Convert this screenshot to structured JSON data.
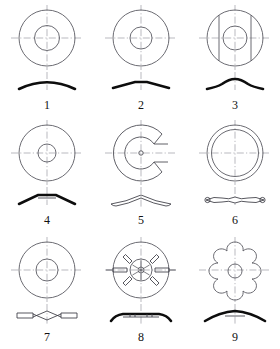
{
  "plate": {
    "title": "Washer types plate",
    "background_color": "#ffffff",
    "line_color": "#5a5a62",
    "centerline_color": "#8b8b93",
    "profile_color": "#0d0d0d",
    "caption_color": "#111111",
    "columns": 3,
    "rows": 3
  },
  "figures": [
    {
      "number": "1",
      "name": "curved-spring-washer",
      "plan_view": "annulus with centerlines",
      "profile_view": "thick curved arc, dished",
      "outer_radius": 28,
      "inner_radius": 12.5,
      "profile_style": "solid-curved-arc"
    },
    {
      "number": "2",
      "name": "conical-belleville-washer",
      "plan_view": "annulus with centerlines",
      "profile_view": "shallow cone, flat tipped",
      "outer_radius": 28,
      "inner_radius": 11,
      "profile_style": "shallow-cone"
    },
    {
      "number": "3",
      "name": "wave-washer-with-flats",
      "plan_view": "annulus with two vertical chord flats",
      "profile_view": "shallow wave with raised centre",
      "outer_radius": 28,
      "inner_radius": 12,
      "profile_style": "wave-flat-sided"
    },
    {
      "number": "4",
      "name": "conical-washer-small-bore",
      "plan_view": "annulus, small bore",
      "profile_view": "pronounced cone with flat crown",
      "outer_radius": 28,
      "inner_radius": 9,
      "profile_style": "cone-flat-crown"
    },
    {
      "number": "5",
      "name": "c-shaped-split-washer",
      "plan_view": "C shape, open slot to the right",
      "profile_view": "thin outlined curved arc",
      "outer_radius": 28,
      "inner_radius": 9,
      "profile_style": "outlined-arc"
    },
    {
      "number": "6",
      "name": "thin-wave-washer",
      "plan_view": "narrow ring, two concentric circles",
      "profile_view": "thin lens with crossing waves",
      "outer_radius": 28,
      "inner_radius": 23,
      "profile_style": "thin-multi-wave"
    },
    {
      "number": "7",
      "name": "crimped-wave-washer",
      "plan_view": "annulus with centerlines",
      "profile_view": "flat ends with crossed zigzag centre",
      "outer_radius": 28,
      "inner_radius": 11,
      "profile_style": "zigzag-crimped"
    },
    {
      "number": "8",
      "name": "tab-lock-washer-slotted",
      "plan_view": "ring with six radial slots and bent tabs, internal teeth hub",
      "profile_view": "flat band with upturned ends and tab marks",
      "outer_radius": 28,
      "inner_radius": 9,
      "slot_count": 6,
      "profile_style": "flat-with-upturned-ends"
    },
    {
      "number": "9",
      "name": "star-external-tooth-washer",
      "plan_view": "six rounded lobes around small bore",
      "profile_view": "thick shallow dome",
      "lobe_count": 6,
      "inner_radius": 7,
      "profile_style": "shallow-dome"
    }
  ]
}
